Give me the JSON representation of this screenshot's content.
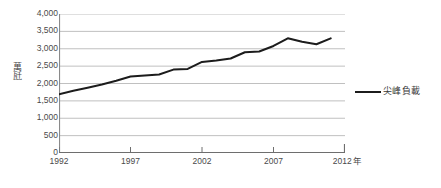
{
  "chart_data": {
    "type": "line",
    "title": "",
    "subtitle": "",
    "xlabel": "年",
    "ylabel": "萬瓩",
    "xlim": [
      1992,
      2012
    ],
    "ylim": [
      0,
      4000
    ],
    "grid": true,
    "legend_position": "right",
    "x_tick_labels": [
      "1992",
      "1997",
      "2002",
      "2007",
      "2012"
    ],
    "x_tick_unit": "年",
    "y_tick_labels": [
      "0",
      "500",
      "1,000",
      "1,500",
      "2,000",
      "2,500",
      "3,000",
      "3,500",
      "4,000"
    ],
    "y_tick_values": [
      0,
      500,
      1000,
      1500,
      2000,
      2500,
      3000,
      3500,
      4000
    ],
    "x": [
      1992,
      1993,
      1994,
      1995,
      1996,
      1997,
      1998,
      1999,
      2000,
      2001,
      2002,
      2003,
      2004,
      2005,
      2006,
      2007,
      2008,
      2009,
      2010,
      2011
    ],
    "series": [
      {
        "name": "尖峰負載",
        "color": "#1c1c1c",
        "values": [
          1690,
          1790,
          1880,
          1970,
          2080,
          2200,
          2230,
          2260,
          2400,
          2420,
          2620,
          2660,
          2720,
          2900,
          2920,
          3080,
          3300,
          3200,
          3130,
          3300
        ]
      }
    ],
    "annotations": []
  },
  "legend": {
    "label": "尖峰負載"
  },
  "axes": {
    "y_title": "萬瓩",
    "x_unit": "年"
  },
  "caption": {
    "text": ""
  }
}
